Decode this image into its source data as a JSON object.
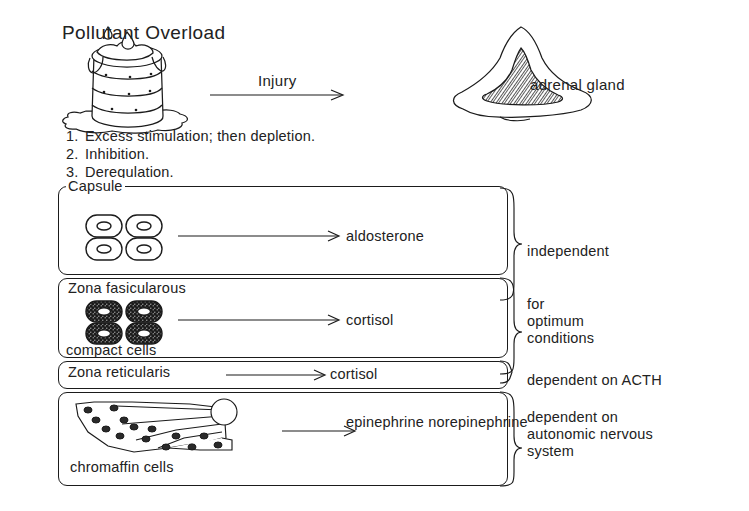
{
  "diagram": {
    "title": "Pollutant Overload",
    "injury_arrow_label": "Injury",
    "gland_label": "adrenal gland",
    "effects": [
      {
        "num": "1.",
        "text": "Excess stimulation; then depletion."
      },
      {
        "num": "2.",
        "text": "Inhibition."
      },
      {
        "num": "3.",
        "text": "Deregulation."
      }
    ],
    "zones": [
      {
        "title": "Capsule",
        "subtitle": "",
        "product": "aldosterone",
        "dependency": "independent",
        "cell_style": "clear-cells",
        "icon": "four-clear-cells-icon"
      },
      {
        "title": "Zona fasicularous",
        "subtitle": "compact cells",
        "product": "cortisol",
        "dependency": "for\noptimum\nconditions",
        "cell_style": "stippled-cells",
        "icon": "four-stippled-cells-icon"
      },
      {
        "title": "Zona reticularis",
        "subtitle": "",
        "product": "cortisol",
        "dependency": "dependent on ACTH",
        "cell_style": "none",
        "icon": "none"
      },
      {
        "title": "",
        "subtitle": "chromaffin cells",
        "product": "epinephrine\nnorepinephrine",
        "dependency": "dependent on\nautonomic nervous\nsystem",
        "cell_style": "chromaffin",
        "icon": "chromaffin-cluster-icon"
      }
    ],
    "colors": {
      "ink": "#1b1b1b",
      "background": "#ffffff"
    }
  }
}
